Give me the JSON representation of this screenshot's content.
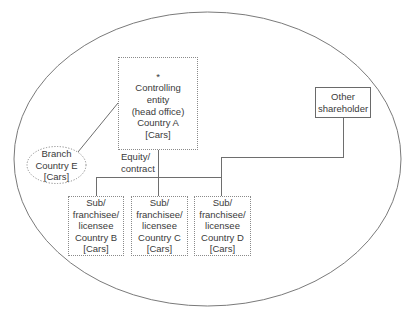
{
  "diagram": {
    "type": "organizational-structure",
    "boundary": {
      "shape": "ellipse",
      "cx": 207.5,
      "cy": 159,
      "rx": 193.5,
      "ry": 147,
      "stroke": "#7a7a7a"
    },
    "nodes": {
      "head_office": {
        "asterisk": "*",
        "lines": [
          "Controlling",
          "entity",
          "(head office)",
          "Country A",
          "[Cars]"
        ],
        "border": "dotted"
      },
      "other_shareholder": {
        "lines": [
          "Other",
          "shareholder"
        ],
        "border": "solid"
      },
      "branch": {
        "lines": [
          "Branch",
          "Country E",
          "[Cars]"
        ],
        "shape": "ellipse",
        "border": "dotted"
      },
      "sub_b": {
        "lines": [
          "Sub/",
          "franchisee/",
          "licensee",
          "Country B",
          "[Cars]"
        ],
        "border": "dotted"
      },
      "sub_c": {
        "lines": [
          "Sub/",
          "franchisee/",
          "licensee",
          "Country C",
          "[Cars]"
        ],
        "border": "dotted"
      },
      "sub_d": {
        "lines": [
          "Sub/",
          "franchisee/",
          "licensee",
          "Country D",
          "[Cars]"
        ],
        "border": "dotted"
      }
    },
    "edge_label": {
      "lines": [
        "Equity/",
        "contract"
      ]
    },
    "colors": {
      "line": "#6e6e6e",
      "text": "#3a3a3a",
      "background": "#ffffff"
    }
  }
}
